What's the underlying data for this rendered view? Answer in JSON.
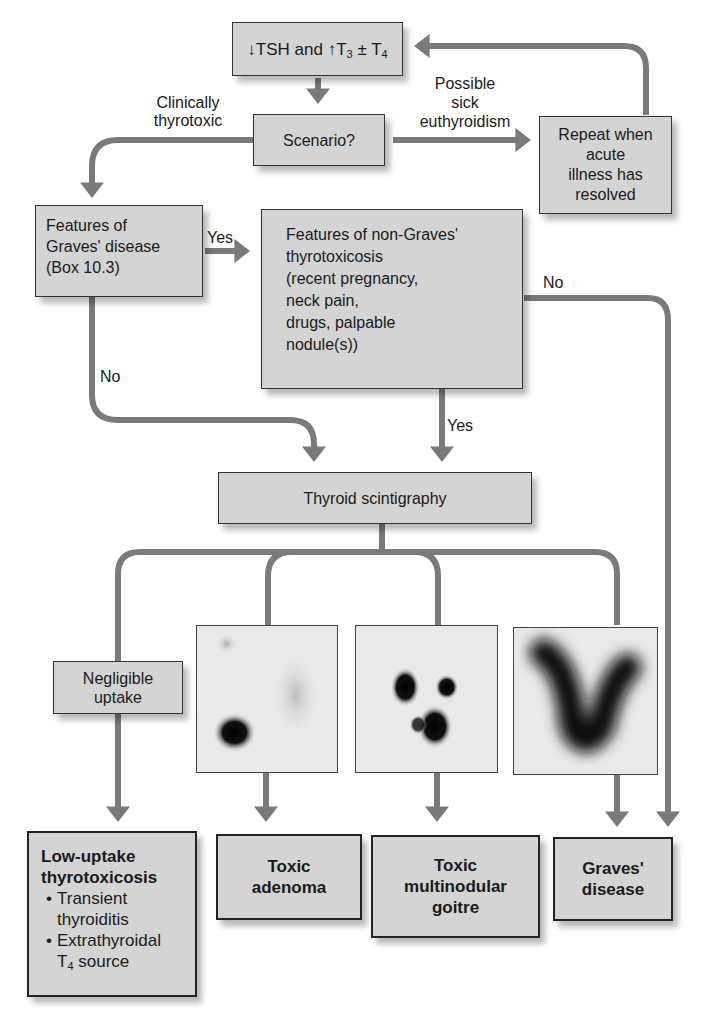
{
  "colors": {
    "arrow": "#7a7a7a",
    "box_fill": "#d4d4d4",
    "box_border": "#333333"
  },
  "nodes": {
    "start": {
      "pre": "↓TSH and ↑T",
      "sub1": "3",
      "mid": " ± T",
      "sub2": "4"
    },
    "scenario": "Scenario?",
    "repeat": [
      "Repeat when",
      "acute",
      "illness has",
      "resolved"
    ],
    "graves_features": [
      "Features of",
      "Graves' disease",
      "(Box 10.3)"
    ],
    "non_graves": [
      "Features of non-Graves'",
      "thyrotoxicosis",
      "(recent pregnancy,",
      "neck pain,",
      "drugs, palpable",
      "nodule(s))"
    ],
    "scintigraphy": "Thyroid scintigraphy",
    "negligible": [
      "Negligible",
      "uptake"
    ]
  },
  "edge_labels": {
    "clinically": [
      "Clinically",
      "thyrotoxic"
    ],
    "sick": [
      "Possible",
      "sick",
      "euthyroidism"
    ],
    "yes1": "Yes",
    "no1": "No",
    "no2": "No",
    "yes2": "Yes"
  },
  "scans": [
    {
      "name": "toxic-adenoma-scan",
      "pattern": "single-hot-nodule"
    },
    {
      "name": "multinodular-scan",
      "pattern": "multiple-hot-nodules"
    },
    {
      "name": "graves-scan",
      "pattern": "diffuse-uptake"
    }
  ],
  "outcomes": {
    "low_uptake": {
      "title": [
        "Low-uptake",
        "thyrotoxicosis"
      ],
      "bullets": [
        "Transient thyroiditis",
        "Extrathyroidal"
      ],
      "last_pre": "T",
      "last_sub": "4",
      "last_post": " source"
    },
    "toxic_adenoma": [
      "Toxic",
      "adenoma"
    ],
    "multinodular": [
      "Toxic",
      "multinodular",
      "goitre"
    ],
    "graves": [
      "Graves'",
      "disease"
    ]
  }
}
